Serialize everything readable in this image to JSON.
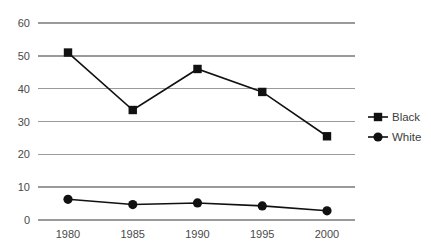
{
  "chart_data": {
    "type": "line",
    "title": "",
    "subtitle": "",
    "xlabel": "",
    "ylabel": "",
    "categories": [
      "1980",
      "1985",
      "1990",
      "1995",
      "2000"
    ],
    "x": [
      1980,
      1985,
      1990,
      1995,
      2000
    ],
    "xlim": [
      1980,
      2000
    ],
    "ylim": [
      0,
      60
    ],
    "yticks": [
      "0",
      "10",
      "20",
      "30",
      "40",
      "50",
      "60"
    ],
    "ytick_values": [
      0,
      10,
      20,
      30,
      40,
      50,
      60
    ],
    "xticks": [
      "1980",
      "1985",
      "1990",
      "1995",
      "2000"
    ],
    "grid": "horizontal",
    "legend_position": "right",
    "series": [
      {
        "name": "Black",
        "marker": "square",
        "color": "#111111",
        "values": [
          51,
          33.5,
          46,
          39,
          25.5
        ]
      },
      {
        "name": "White",
        "marker": "circle",
        "color": "#111111",
        "values": [
          6.3,
          4.7,
          5.2,
          4.3,
          2.8
        ]
      }
    ],
    "annotations": []
  },
  "legend": {
    "items": [
      {
        "label": "Black",
        "marker": "square"
      },
      {
        "label": "White",
        "marker": "circle"
      }
    ]
  },
  "colors": {
    "gridline": "#9a9a9a",
    "series": "#111111",
    "tick_text": "#4a4a4a",
    "legend_text": "#3d3d3d",
    "background": "#ffffff"
  }
}
